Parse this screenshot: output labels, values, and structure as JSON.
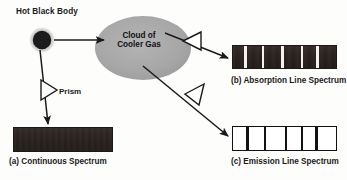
{
  "figure": {
    "colors": {
      "background": "#fdfdfc",
      "cloud_fill": "#a8a8a8",
      "blackbody_core": "#1c1c1c",
      "blackbody_halo": "#9a9a9a",
      "stroke": "#1a1a1a",
      "spectrum_dark": "#2a2320",
      "spectrum_light": "#ffffff"
    }
  },
  "labels": {
    "hot_black_body": "Hot Black Body",
    "prism": "Prism",
    "cloud_line1": "Cloud of",
    "cloud_line2": "Cooler Gas"
  },
  "captions": {
    "a": "(a) Continuous Spectrum",
    "b": "(b) Absorption Line Spectrum",
    "c": "(c) Emission Line Spectrum"
  },
  "icons": {
    "blackbody": "filled-circle-icon",
    "cloud": "ellipse-icon",
    "prism_top": "prism-triangle-icon",
    "prism_left": "prism-triangle-icon",
    "prism_bottom": "prism-triangle-icon",
    "arrow": "arrow-icon"
  },
  "chart_data": {
    "type": "diagram",
    "nodes": [
      {
        "id": "blackbody",
        "label": "Hot Black Body",
        "shape": "circle",
        "cx": 42,
        "cy": 40,
        "r": 9
      },
      {
        "id": "cloud",
        "label": "Cloud of Cooler Gas",
        "shape": "ellipse",
        "cx": 143,
        "cy": 48,
        "rx": 48,
        "ry": 32
      },
      {
        "id": "prism_continuous",
        "label": "Prism",
        "shape": "triangle",
        "orientation": "right"
      },
      {
        "id": "prism_absorption",
        "label": "",
        "shape": "triangle",
        "orientation": "left"
      },
      {
        "id": "prism_emission",
        "label": "",
        "shape": "triangle",
        "orientation": "down-left"
      }
    ],
    "edges": [
      {
        "from": "blackbody",
        "to": "cloud",
        "style": "solid-arrow"
      },
      {
        "from": "blackbody",
        "to": "spectrum_continuous",
        "style": "solid-arrow",
        "through": "prism_continuous"
      },
      {
        "from": "cloud",
        "to": "spectrum_absorption",
        "style": "solid-arrow",
        "through": "prism_absorption"
      },
      {
        "from": "cloud",
        "to": "spectrum_emission",
        "style": "solid-arrow",
        "through": "prism_emission"
      }
    ],
    "spectra": [
      {
        "id": "spectrum_continuous",
        "caption": "(a) Continuous Spectrum",
        "kind": "continuous",
        "background": "dark",
        "lines": []
      },
      {
        "id": "spectrum_absorption",
        "caption": "(b) Absorption Line Spectrum",
        "kind": "absorption",
        "background": "dark",
        "line_color": "white",
        "line_count": 5,
        "lines": [
          {
            "position_pct": 11,
            "width_px": 2.5
          },
          {
            "position_pct": 28,
            "width_px": 2.5
          },
          {
            "position_pct": 47,
            "width_px": 2.5
          },
          {
            "position_pct": 66,
            "width_px": 2.5
          },
          {
            "position_pct": 81,
            "width_px": 2.5
          }
        ]
      },
      {
        "id": "spectrum_emission",
        "caption": "(c) Emission Line Spectrum",
        "kind": "emission",
        "background": "white",
        "line_color": "black",
        "line_count": 5,
        "lines": [
          {
            "position_pct": 13,
            "width_px": 2.2
          },
          {
            "position_pct": 30,
            "width_px": 2.2
          },
          {
            "position_pct": 50,
            "width_px": 2.2
          },
          {
            "position_pct": 66,
            "width_px": 2.2
          },
          {
            "position_pct": 80,
            "width_px": 2.2
          }
        ]
      }
    ]
  }
}
